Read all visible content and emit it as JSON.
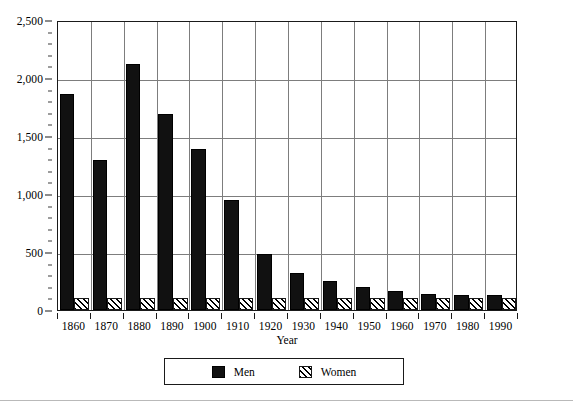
{
  "chart_data": {
    "type": "bar",
    "title": "",
    "xlabel": "Year",
    "ylabel": "",
    "categories": [
      "1860",
      "1870",
      "1880",
      "1890",
      "1900",
      "1910",
      "1920",
      "1930",
      "1940",
      "1950",
      "1960",
      "1970",
      "1980",
      "1990"
    ],
    "series": [
      {
        "name": "Men",
        "color": "#111111",
        "pattern": "solid",
        "values": [
          1860,
          1290,
          2120,
          1690,
          1390,
          950,
          480,
          320,
          250,
          200,
          165,
          140,
          130,
          130
        ]
      },
      {
        "name": "Women",
        "color": "#000000",
        "pattern": "diagonal-hatch",
        "values": [
          100,
          100,
          100,
          100,
          100,
          100,
          100,
          100,
          100,
          100,
          100,
          100,
          100,
          100
        ]
      }
    ],
    "ylim": [
      0,
      2500
    ],
    "ytick_values": [
      0,
      500,
      1000,
      1500,
      2000,
      2500
    ],
    "ytick_labels": [
      "0",
      "500",
      "1,000",
      "1,500",
      "2,000",
      "2,500"
    ],
    "yminor_step": 100,
    "grid": "both",
    "legend_position": "bottom-center",
    "legend": [
      {
        "label": "Men",
        "swatch": "solid-black-square"
      },
      {
        "label": "Women",
        "swatch": "hatched-square"
      }
    ]
  }
}
